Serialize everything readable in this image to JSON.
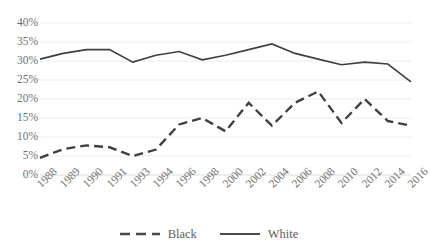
{
  "chart_data": {
    "type": "line",
    "title": "",
    "xlabel": "",
    "ylabel": "",
    "ylim": [
      0,
      40
    ],
    "ytick_labels": [
      "0%",
      "5%",
      "10%",
      "15%",
      "20%",
      "25%",
      "30%",
      "35%",
      "40%"
    ],
    "ytick_values": [
      0,
      5,
      10,
      15,
      20,
      25,
      30,
      35,
      40
    ],
    "grid": true,
    "grid_axis": "y",
    "legend_position": "bottom",
    "categories": [
      "1988",
      "1989",
      "1990",
      "1991",
      "1993",
      "1994",
      "1996",
      "1998",
      "2000",
      "2002",
      "2004",
      "2006",
      "2008",
      "2010",
      "2012",
      "2014",
      "2016"
    ],
    "series": [
      {
        "name": "Black",
        "style": "dashed",
        "color": "#404040",
        "values": [
          4.5,
          6.8,
          7.8,
          7.3,
          5.0,
          6.7,
          13.3,
          15.0,
          11.5,
          19.0,
          13.0,
          19.0,
          22.0,
          13.7,
          20.0,
          14.2,
          13.0
        ]
      },
      {
        "name": "White",
        "style": "solid",
        "color": "#404040",
        "values": [
          30.5,
          32.0,
          33.0,
          33.0,
          29.7,
          31.5,
          32.5,
          30.3,
          31.5,
          33.0,
          34.5,
          32.0,
          30.5,
          29.0,
          29.7,
          29.2,
          24.5
        ]
      }
    ]
  },
  "legend": {
    "items": [
      {
        "label": "Black",
        "style": "dashed"
      },
      {
        "label": "White",
        "style": "solid"
      }
    ]
  }
}
